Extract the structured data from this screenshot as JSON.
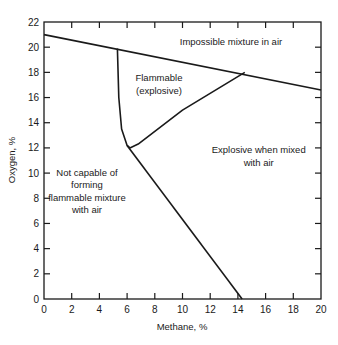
{
  "chart_data": {
    "type": "line",
    "title": "",
    "xlabel": "Methane, %",
    "ylabel": "Oxygen, %",
    "xlim": [
      0,
      20
    ],
    "ylim": [
      0,
      22
    ],
    "x_ticks": [
      "0",
      "2",
      "4",
      "6",
      "8",
      "10",
      "12",
      "14",
      "16",
      "18",
      "20"
    ],
    "y_ticks": [
      "0",
      "2",
      "4",
      "6",
      "8",
      "10",
      "12",
      "14",
      "16",
      "18",
      "20",
      "22"
    ],
    "grid": false,
    "series": [
      {
        "name": "air-dilution-line",
        "points": [
          [
            0,
            21.0
          ],
          [
            20,
            16.6
          ]
        ]
      },
      {
        "name": "lower-limit-boundary",
        "points": [
          [
            5.3,
            19.9
          ],
          [
            5.4,
            16.0
          ],
          [
            5.6,
            13.5
          ],
          [
            6.0,
            12.2
          ],
          [
            6.2,
            12.0
          ]
        ]
      },
      {
        "name": "upper-limit-boundary",
        "points": [
          [
            6.2,
            12.0
          ],
          [
            6.8,
            12.3
          ],
          [
            10.0,
            15.0
          ],
          [
            14.5,
            18.0
          ]
        ]
      },
      {
        "name": "nose-limit-line",
        "points": [
          [
            6.0,
            12.2
          ],
          [
            14.3,
            0
          ]
        ]
      }
    ],
    "annotations": [
      {
        "text": "Impossible mixture in air",
        "x": 13.5,
        "y": 20.2
      },
      {
        "text": "Flammable",
        "x": 8.3,
        "y": 17.3
      },
      {
        "text": "(explosive)",
        "x": 8.3,
        "y": 16.3
      },
      {
        "text": "Explosive when mixed",
        "x": 15.5,
        "y": 11.6
      },
      {
        "text": "with air",
        "x": 15.5,
        "y": 10.6
      },
      {
        "text": "Not capable of",
        "x": 3.1,
        "y": 9.8
      },
      {
        "text": "forming",
        "x": 3.1,
        "y": 8.8
      },
      {
        "text": "flammable mixture",
        "x": 3.1,
        "y": 7.8
      },
      {
        "text": "with air",
        "x": 3.1,
        "y": 6.8
      }
    ]
  }
}
